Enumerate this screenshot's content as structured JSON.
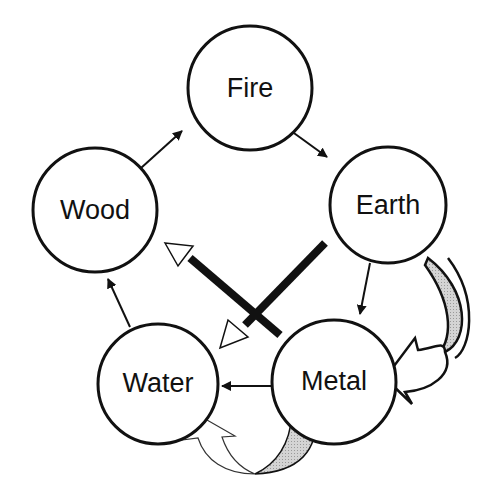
{
  "diagram": {
    "title": "",
    "colors": {
      "stroke": "#111111",
      "hatch_fill": "#c8c8c8",
      "background": "#ffffff"
    },
    "nodes": [
      {
        "id": "fire",
        "label": "Fire"
      },
      {
        "id": "earth",
        "label": "Earth"
      },
      {
        "id": "metal",
        "label": "Metal"
      },
      {
        "id": "water",
        "label": "Water"
      },
      {
        "id": "wood",
        "label": "Wood"
      }
    ],
    "edges": [
      {
        "from": "wood",
        "to": "fire",
        "type": "generating-arrow"
      },
      {
        "from": "fire",
        "to": "earth",
        "type": "generating-arrow"
      },
      {
        "from": "earth",
        "to": "metal",
        "type": "generating-arrow"
      },
      {
        "from": "metal",
        "to": "water",
        "type": "generating-arrow"
      },
      {
        "from": "water",
        "to": "wood",
        "type": "generating-arrow"
      },
      {
        "from": "earth",
        "to": "water",
        "type": "thick-bar-open-arrow"
      },
      {
        "from": "metal",
        "to": "wood",
        "type": "thick-bar-open-arrow"
      },
      {
        "from": "earth",
        "to": "metal",
        "type": "curved-hatched-block-arrow"
      },
      {
        "from": "metal",
        "to": "water",
        "type": "curved-hatched-block-arrow"
      }
    ]
  }
}
